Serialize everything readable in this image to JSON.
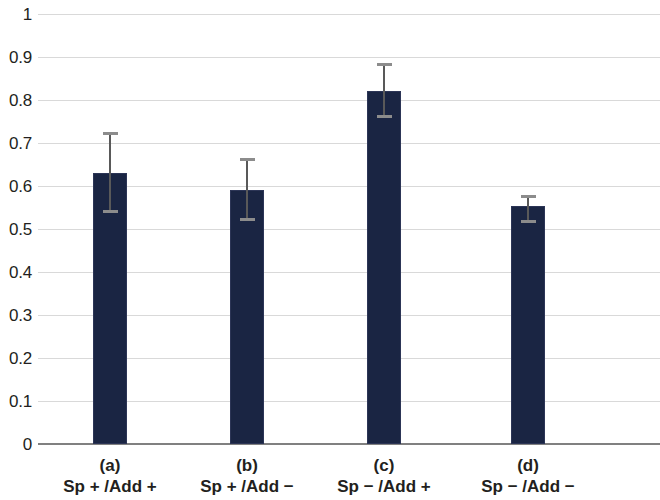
{
  "chart_data": {
    "type": "bar",
    "title": "",
    "subtitle": "",
    "xlabel": "",
    "ylabel": "",
    "categories": [
      "Sp + /Add +",
      "Sp + /Add −",
      "Sp − /Add +",
      "Sp − /Add −"
    ],
    "category_keys": [
      "(a)",
      "(b)",
      "(c)",
      "(d)"
    ],
    "values": [
      0.63,
      0.59,
      0.82,
      0.553
    ],
    "errors_upper": [
      0.095,
      0.075,
      0.065,
      0.027
    ],
    "errors_lower": [
      0.093,
      0.072,
      0.063,
      0.038
    ],
    "error_top_values": [
      0.725,
      0.665,
      0.885,
      0.58
    ],
    "error_bottom_values": [
      0.537,
      0.518,
      0.757,
      0.515
    ],
    "ylim": [
      0,
      1
    ],
    "ytick_values": [
      0,
      0.1,
      0.2,
      0.3,
      0.4,
      0.5,
      0.6,
      0.7,
      0.8,
      0.9,
      1
    ],
    "ytick_labels": [
      "0",
      "0.1",
      "0.2",
      "0.3",
      "0.4",
      "0.5",
      "0.6",
      "0.7",
      "0.8",
      "0.9",
      "1"
    ],
    "grid": true,
    "legend": false,
    "legend_position": "none",
    "bar_color": "#1a2543",
    "grid_color": "#d9d9d9",
    "axis_color": "#808080",
    "error_bar_color": "#595959",
    "text_color": "#231f20"
  },
  "layout": {
    "plot_left": 38,
    "plot_right": 660,
    "y_zero_px": 444,
    "y_one_px": 14,
    "bar_width_px": 34,
    "bar_centers_px": [
      110,
      247,
      384,
      528
    ]
  }
}
